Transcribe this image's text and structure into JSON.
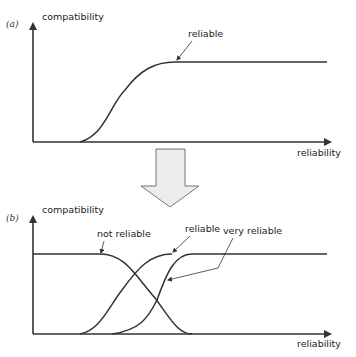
{
  "diagram": {
    "panel_a": {
      "tag": "(a)",
      "y_axis_label": "compatibility",
      "x_axis_label": "reliability",
      "curves": [
        {
          "name": "reliable",
          "shape": "rising sigmoid"
        }
      ],
      "annotations": [
        "reliable"
      ]
    },
    "transition_arrow": {
      "direction": "down",
      "color": "#e6e6e6"
    },
    "panel_b": {
      "tag": "(b)",
      "y_axis_label": "compatibility",
      "x_axis_label": "reliability",
      "curves": [
        {
          "name": "not reliable",
          "shape": "falling sigmoid"
        },
        {
          "name": "reliable",
          "shape": "rising sigmoid"
        },
        {
          "name": "very reliable",
          "shape": "rising sigmoid, shifted right"
        }
      ],
      "annotations": [
        "not reliable",
        "reliable",
        "very reliable"
      ]
    }
  }
}
